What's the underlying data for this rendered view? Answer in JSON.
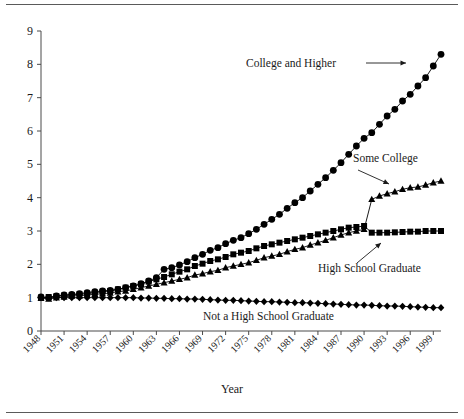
{
  "figure": {
    "background_color": "#ffffff",
    "foreground_color": "#000000",
    "frame_color": "#5a5a5a"
  },
  "axis_titles": {
    "x": "Year",
    "y": ""
  },
  "annotations": [
    {
      "id": "college-and-higher",
      "label": "College and Higher"
    },
    {
      "id": "some-college",
      "label": "Some College"
    },
    {
      "id": "high-school-graduate",
      "label": "High School Graduate"
    },
    {
      "id": "not-a-high-school-graduate",
      "label": "Not a High School Graduate"
    }
  ],
  "chart_data": {
    "type": "line",
    "title": "",
    "subtitle": "",
    "xlabel": "Year",
    "ylabel": "",
    "grid": false,
    "legend_position": "inline-annotations",
    "xlim": [
      1948,
      2000
    ],
    "ylim": [
      0,
      9
    ],
    "yticks": [
      0,
      1,
      2,
      3,
      4,
      5,
      6,
      7,
      8,
      9
    ],
    "ytick_labels": [
      "0",
      "1",
      "2",
      "3",
      "4",
      "5",
      "6",
      "7",
      "8",
      "9"
    ],
    "xticks": [
      1948,
      1951,
      1954,
      1957,
      1960,
      1963,
      1966,
      1969,
      1972,
      1975,
      1978,
      1981,
      1984,
      1987,
      1990,
      1993,
      1996,
      1999
    ],
    "xtick_labels": [
      "1948",
      "1951",
      "1954",
      "1957",
      "1960",
      "1963",
      "1966",
      "1969",
      "1972",
      "1975",
      "1978",
      "1981",
      "1984",
      "1987",
      "1990",
      "1993",
      "1996",
      "1999"
    ],
    "x": [
      1948,
      1949,
      1950,
      1951,
      1952,
      1953,
      1954,
      1955,
      1956,
      1957,
      1958,
      1959,
      1960,
      1961,
      1962,
      1963,
      1964,
      1965,
      1966,
      1967,
      1968,
      1969,
      1970,
      1971,
      1972,
      1973,
      1974,
      1975,
      1976,
      1977,
      1978,
      1979,
      1980,
      1981,
      1982,
      1983,
      1984,
      1985,
      1986,
      1987,
      1988,
      1989,
      1990,
      1991,
      1992,
      1993,
      1994,
      1995,
      1996,
      1997,
      1998,
      1999,
      2000
    ],
    "series": [
      {
        "name": "College and Higher",
        "marker": "circle",
        "values": [
          1.02,
          1.0,
          1.05,
          1.08,
          1.1,
          1.12,
          1.15,
          1.18,
          1.2,
          1.22,
          1.25,
          1.3,
          1.35,
          1.42,
          1.5,
          1.6,
          1.85,
          1.9,
          1.98,
          2.08,
          2.2,
          2.3,
          2.42,
          2.5,
          2.62,
          2.72,
          2.8,
          2.92,
          3.05,
          3.2,
          3.35,
          3.5,
          3.68,
          3.85,
          4.0,
          4.2,
          4.4,
          4.6,
          4.82,
          5.05,
          5.3,
          5.55,
          5.78,
          5.95,
          6.2,
          6.45,
          6.65,
          6.9,
          7.1,
          7.35,
          7.6,
          7.95,
          8.3
        ]
      },
      {
        "name": "Some College",
        "marker": "triangle",
        "values": [
          0.98,
          0.96,
          1.0,
          1.02,
          1.05,
          1.06,
          1.08,
          1.1,
          1.12,
          1.14,
          1.18,
          1.2,
          1.25,
          1.3,
          1.35,
          1.4,
          1.45,
          1.5,
          1.55,
          1.6,
          1.68,
          1.72,
          1.78,
          1.82,
          1.9,
          1.95,
          2.0,
          2.05,
          2.12,
          2.2,
          2.25,
          2.3,
          2.38,
          2.45,
          2.5,
          2.58,
          2.65,
          2.72,
          2.8,
          2.88,
          2.95,
          3.0,
          3.05,
          3.95,
          4.05,
          4.12,
          4.18,
          4.25,
          4.3,
          4.32,
          4.38,
          4.45,
          4.5
        ]
      },
      {
        "name": "High School Graduate",
        "marker": "square",
        "values": [
          1.0,
          1.02,
          1.04,
          1.06,
          1.08,
          1.1,
          1.12,
          1.15,
          1.18,
          1.2,
          1.25,
          1.3,
          1.35,
          1.4,
          1.48,
          1.55,
          1.62,
          1.7,
          1.78,
          1.85,
          1.95,
          2.02,
          2.1,
          2.15,
          2.22,
          2.3,
          2.35,
          2.4,
          2.48,
          2.55,
          2.6,
          2.65,
          2.7,
          2.75,
          2.8,
          2.85,
          2.9,
          2.95,
          3.0,
          3.05,
          3.1,
          3.12,
          3.15,
          2.95,
          2.95,
          2.95,
          2.96,
          2.97,
          2.98,
          2.98,
          3.0,
          3.0,
          3.0
        ]
      },
      {
        "name": "Not a High School Graduate",
        "marker": "diamond",
        "values": [
          1.0,
          1.0,
          1.0,
          1.0,
          1.0,
          1.0,
          1.0,
          1.0,
          1.0,
          1.0,
          1.0,
          1.0,
          1.0,
          0.99,
          0.99,
          0.98,
          0.98,
          0.97,
          0.97,
          0.96,
          0.96,
          0.95,
          0.94,
          0.93,
          0.92,
          0.92,
          0.91,
          0.9,
          0.89,
          0.88,
          0.88,
          0.87,
          0.86,
          0.85,
          0.85,
          0.84,
          0.83,
          0.82,
          0.81,
          0.8,
          0.79,
          0.78,
          0.78,
          0.77,
          0.76,
          0.75,
          0.75,
          0.74,
          0.73,
          0.72,
          0.71,
          0.7,
          0.7
        ]
      }
    ]
  }
}
